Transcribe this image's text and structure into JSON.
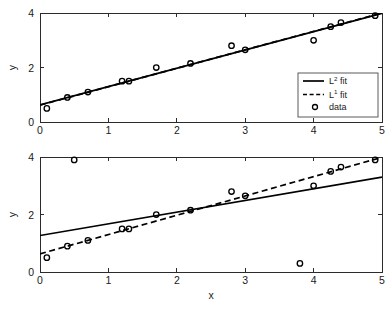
{
  "figure": {
    "background": "#ffffff",
    "line_color": "#000000",
    "axis_color": "#2b2b2b"
  },
  "legend": {
    "position": "lower-right-of-top-panel",
    "entries": [
      {
        "label_base": "L",
        "label_sup": "2",
        "label_tail": " fit",
        "style": "solid",
        "name": "l2-fit"
      },
      {
        "label_base": "L",
        "label_sup": "1",
        "label_tail": " fit",
        "style": "dashed",
        "name": "l1-fit"
      },
      {
        "label_base": "data",
        "label_sup": "",
        "label_tail": "",
        "style": "marker",
        "name": "data"
      }
    ]
  },
  "chart_data": [
    {
      "type": "scatter",
      "panel": "top",
      "title": "",
      "xlabel": "",
      "ylabel": "y",
      "xlim": [
        0,
        5
      ],
      "ylim": [
        0,
        4
      ],
      "xticks": [
        0,
        1,
        2,
        3,
        4,
        5
      ],
      "yticks": [
        0,
        2,
        4
      ],
      "xticklabels": [
        "0",
        "1",
        "2",
        "3",
        "4",
        "5"
      ],
      "yticklabels": [
        "0",
        "2",
        "4"
      ],
      "grid": false,
      "points": {
        "name": "data",
        "marker": "circle",
        "x": [
          0.1,
          0.4,
          0.7,
          1.2,
          1.3,
          1.7,
          2.2,
          2.8,
          3.0,
          4.0,
          4.25,
          4.4,
          4.9
        ],
        "y": [
          0.5,
          0.9,
          1.1,
          1.5,
          1.5,
          2.0,
          2.15,
          2.8,
          2.65,
          3.0,
          3.5,
          3.65,
          3.9
        ]
      },
      "series": [
        {
          "name": "L2 fit",
          "style": "solid",
          "type": "line",
          "intercept": 0.63,
          "slope": 0.672,
          "x": [
            0,
            5
          ],
          "y": [
            0.63,
            3.99
          ]
        },
        {
          "name": "L1 fit",
          "style": "dashed",
          "type": "line",
          "intercept": 0.62,
          "slope": 0.676,
          "x": [
            0,
            5
          ],
          "y": [
            0.62,
            4.0
          ]
        }
      ]
    },
    {
      "type": "scatter",
      "panel": "bottom",
      "title": "",
      "xlabel": "x",
      "ylabel": "y",
      "xlim": [
        0,
        5
      ],
      "ylim": [
        0,
        4
      ],
      "xticks": [
        0,
        1,
        2,
        3,
        4,
        5
      ],
      "yticks": [
        0,
        2,
        4
      ],
      "xticklabels": [
        "0",
        "1",
        "2",
        "3",
        "4",
        "5"
      ],
      "yticklabels": [
        "0",
        "2",
        "4"
      ],
      "grid": false,
      "points": {
        "name": "data",
        "marker": "circle",
        "x": [
          0.1,
          0.4,
          0.5,
          0.7,
          1.2,
          1.3,
          1.7,
          2.2,
          2.8,
          3.0,
          3.8,
          4.0,
          4.25,
          4.4,
          4.9
        ],
        "y": [
          0.5,
          0.9,
          3.9,
          1.1,
          1.5,
          1.5,
          2.0,
          2.15,
          2.8,
          2.65,
          0.3,
          3.0,
          3.5,
          3.65,
          3.9
        ]
      },
      "series": [
        {
          "name": "L2 fit",
          "style": "solid",
          "type": "line",
          "intercept": 1.27,
          "slope": 0.406,
          "x": [
            0,
            5
          ],
          "y": [
            1.27,
            3.3
          ]
        },
        {
          "name": "L1 fit",
          "style": "dashed",
          "type": "line",
          "intercept": 0.63,
          "slope": 0.672,
          "x": [
            0,
            5
          ],
          "y": [
            0.63,
            3.99
          ]
        }
      ]
    }
  ]
}
